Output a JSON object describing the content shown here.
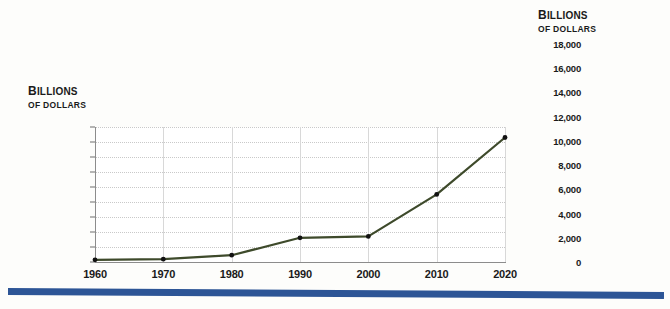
{
  "chart_data": [
    {
      "id": "main",
      "type": "line",
      "title": "",
      "ylabel_line1": "Billions",
      "ylabel_line2": "OF DOLLARS",
      "xlabel": "",
      "x": [
        1960,
        1970,
        1980,
        1990,
        2000,
        2010,
        2020
      ],
      "categories": [
        "1960",
        "1970",
        "1980",
        "1990",
        "2000",
        "2010",
        "2020"
      ],
      "values": [
        290,
        370,
        910,
        3230,
        3410,
        9020,
        16600
      ],
      "ylim": [
        0,
        18000
      ],
      "yticks": [
        0,
        2000,
        4000,
        6000,
        8000,
        10000,
        12000,
        14000,
        16000,
        18000
      ],
      "ytick_labels": [
        "0",
        "2,000",
        "4,000",
        "6,000",
        "8,000",
        "10,000",
        "12,000",
        "14,000",
        "16,000",
        "18,000"
      ],
      "xlim": [
        1960,
        2020
      ],
      "grid": "both",
      "legend": "none",
      "line_color": "#3e4a2b",
      "marker_color": "#111111"
    },
    {
      "id": "inset",
      "type": "line",
      "title": "",
      "ylabel_line1": "Billions",
      "ylabel_line2": "OF DOLLARS",
      "xlabel": "",
      "x": [
        1960,
        1970,
        1980,
        1990,
        2000,
        2010,
        2020
      ],
      "categories": [
        "1960",
        "1970",
        "1980",
        "1990",
        "2000",
        "2010",
        "2020"
      ],
      "values": [
        290,
        370,
        910,
        3230,
        3410,
        9020,
        16600
      ],
      "ylim": [
        0,
        18000
      ],
      "yticks": [
        0,
        2000,
        4000,
        6000,
        8000,
        10000,
        12000,
        14000,
        16000,
        18000
      ],
      "ytick_labels": [
        "0",
        "2,000",
        "4,000",
        "6,000",
        "8,000",
        "10,000",
        "12,000",
        "14,000",
        "16,000",
        "18,000"
      ],
      "xtick_labels": [
        "1970",
        "1990",
        "2010"
      ],
      "xtick_values": [
        1970,
        1990,
        2010
      ],
      "xlim": [
        1960,
        2020
      ],
      "grid": "both",
      "legend": "none",
      "line_color": "#3e4a2b",
      "marker_color": "#111111"
    }
  ],
  "colors": {
    "line": "#3e4a2b",
    "rule": "#2d5596",
    "grid": "#c9c9c9",
    "axis": "#8c8c8c",
    "background": "#fdfdfb"
  },
  "bottom_rule": {
    "label": "divider-rule"
  }
}
